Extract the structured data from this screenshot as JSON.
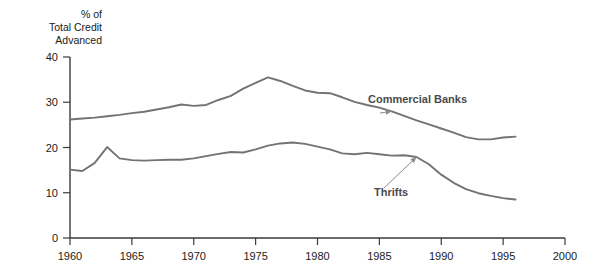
{
  "chart_data": {
    "type": "line",
    "title": "",
    "ylabel": "% of Total Credit Advanced",
    "ylabel_lines": [
      "% of",
      "Total Credit",
      "Advanced"
    ],
    "xlabel": "",
    "xlim": [
      1960,
      2000
    ],
    "ylim": [
      0,
      40
    ],
    "yticks": [
      0,
      10,
      20,
      30,
      40
    ],
    "ytick_labels": [
      "0",
      "10",
      "20",
      "30",
      "40"
    ],
    "xticks": [
      1960,
      1965,
      1970,
      1975,
      1980,
      1985,
      1990,
      1995,
      2000
    ],
    "xtick_labels": [
      "1960",
      "1965",
      "1970",
      "1975",
      "1980",
      "1985",
      "1990",
      "1995",
      "2000"
    ],
    "grid": false,
    "legend_position": "inline-annotation",
    "line_color": "#737373",
    "axis_color": "#3a3a3a",
    "series": [
      {
        "name": "Commercial Banks",
        "label": "Commercial Banks",
        "x": [
          1960,
          1961,
          1962,
          1963,
          1964,
          1965,
          1966,
          1967,
          1968,
          1969,
          1970,
          1971,
          1972,
          1973,
          1974,
          1975,
          1976,
          1977,
          1978,
          1979,
          1980,
          1981,
          1982,
          1983,
          1984,
          1985,
          1986,
          1987,
          1988,
          1989,
          1990,
          1991,
          1992,
          1993,
          1994,
          1995,
          1996
        ],
        "values": [
          26.2,
          26.4,
          26.6,
          26.9,
          27.2,
          27.6,
          27.9,
          28.4,
          28.9,
          29.5,
          29.2,
          29.4,
          30.5,
          31.4,
          33.0,
          34.3,
          35.5,
          34.7,
          33.6,
          32.6,
          32.1,
          32.0,
          31.1,
          30.1,
          29.4,
          28.8,
          28.0,
          27.0,
          26.0,
          25.1,
          24.2,
          23.3,
          22.3,
          21.8,
          21.8,
          22.2,
          22.4
        ]
      },
      {
        "name": "Thrifts",
        "label": "Thrifts",
        "x": [
          1960,
          1961,
          1962,
          1963,
          1964,
          1965,
          1966,
          1967,
          1968,
          1969,
          1970,
          1971,
          1972,
          1973,
          1974,
          1975,
          1976,
          1977,
          1978,
          1979,
          1980,
          1981,
          1982,
          1983,
          1984,
          1985,
          1986,
          1987,
          1988,
          1989,
          1990,
          1991,
          1992,
          1993,
          1994,
          1995,
          1996
        ],
        "values": [
          15.1,
          14.8,
          16.6,
          20.1,
          17.6,
          17.2,
          17.1,
          17.2,
          17.3,
          17.3,
          17.6,
          18.1,
          18.6,
          19.0,
          18.9,
          19.6,
          20.4,
          20.9,
          21.1,
          20.8,
          20.2,
          19.6,
          18.7,
          18.5,
          18.8,
          18.5,
          18.2,
          18.3,
          17.9,
          16.3,
          14.0,
          12.2,
          10.8,
          9.9,
          9.3,
          8.8,
          8.5
        ]
      }
    ],
    "annotations": [
      {
        "text": "Commercial Banks",
        "target_series": "Commercial Banks",
        "target_x": 1986,
        "target_y": 28.0
      },
      {
        "text": "Thrifts",
        "target_series": "Thrifts",
        "target_x": 1988,
        "target_y": 17.9
      }
    ]
  }
}
